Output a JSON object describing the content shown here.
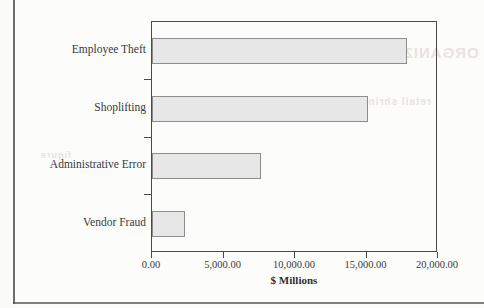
{
  "chart_data": {
    "type": "bar",
    "orientation": "horizontal",
    "title": "",
    "xlabel": "$ Millions",
    "ylabel": "",
    "categories": [
      "Employee Theft",
      "Shoplifting",
      "Administrative Error",
      "Vendor Fraud"
    ],
    "values": [
      17800,
      15100,
      7600,
      2300
    ],
    "xlim": [
      0,
      20000
    ],
    "xticks": [
      0,
      5000,
      10000,
      15000,
      20000
    ],
    "xtick_labels": [
      "0.00",
      "5,000.00",
      "10,000.00",
      "15,000.00",
      "20,000.00"
    ],
    "grid": false,
    "legend": false,
    "bar_fill": "#e7e7e7",
    "bar_edge": "#8d8d8d",
    "axis_color": "#4a4a4a",
    "background": "#fcfcfb"
  },
  "artifacts": {
    "bleed_text_1": "ORGANIZATIONAL",
    "bleed_text_2": "retail shrinkage losses",
    "bleed_text_3": "figure"
  }
}
